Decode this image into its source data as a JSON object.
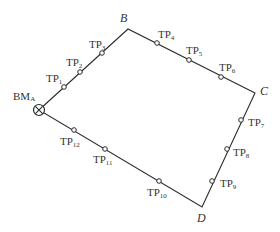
{
  "diagram": {
    "type": "closed leveling route",
    "colors": {
      "line": "#2b2b2b",
      "text": "#333333",
      "background": "#ffffff"
    },
    "benchmark": {
      "label": "BM",
      "subscript": "A",
      "x": 39,
      "y": 110,
      "icon": "circle-x-icon"
    },
    "vertices": [
      {
        "id": "B",
        "label": "B",
        "x": 128,
        "y": 29,
        "lx": 120,
        "ly": 22
      },
      {
        "id": "C",
        "label": "C",
        "x": 255,
        "y": 93,
        "lx": 260,
        "ly": 95
      },
      {
        "id": "D",
        "label": "D",
        "x": 202,
        "y": 207,
        "lx": 197,
        "ly": 222
      }
    ],
    "turning_points": [
      {
        "label": "TP",
        "sub": "1",
        "x": 64,
        "y": 87,
        "lx": 46,
        "ly": 82
      },
      {
        "label": "TP",
        "sub": "2",
        "x": 80,
        "y": 72,
        "lx": 66,
        "ly": 66
      },
      {
        "label": "TP",
        "sub": "3",
        "x": 102,
        "y": 53,
        "lx": 89,
        "ly": 48
      },
      {
        "label": "TP",
        "sub": "4",
        "x": 157,
        "y": 43,
        "lx": 158,
        "ly": 38
      },
      {
        "label": "TP",
        "sub": "5",
        "x": 189,
        "y": 60,
        "lx": 186,
        "ly": 54
      },
      {
        "label": "TP",
        "sub": "6",
        "x": 221,
        "y": 77,
        "lx": 219,
        "ly": 71
      },
      {
        "label": "TP",
        "sub": "7",
        "x": 241,
        "y": 120,
        "lx": 248,
        "ly": 126
      },
      {
        "label": "TP",
        "sub": "8",
        "x": 227,
        "y": 149,
        "lx": 233,
        "ly": 156
      },
      {
        "label": "TP",
        "sub": "9",
        "x": 212,
        "y": 181,
        "lx": 220,
        "ly": 187
      },
      {
        "label": "TP",
        "sub": "10",
        "x": 159,
        "y": 181,
        "lx": 147,
        "ly": 196
      },
      {
        "label": "TP",
        "sub": "11",
        "x": 105,
        "y": 149,
        "lx": 93,
        "ly": 163
      },
      {
        "label": "TP",
        "sub": "12",
        "x": 74,
        "y": 130,
        "lx": 60,
        "ly": 145
      }
    ]
  }
}
